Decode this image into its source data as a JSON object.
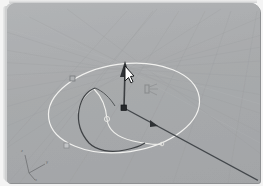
{
  "app": {
    "title": "3D Modeling Viewport",
    "view_label": "Perspective"
  },
  "viewport": {
    "background_color": "#a9abad",
    "grid_color": "#9b9d9f",
    "grid_highlight_color": "#b9bbbd",
    "frame_color": "#f4f4f4",
    "border_radius": "9px"
  },
  "axis_gizmo": {
    "name": "world-axis-indicator",
    "labels": {
      "z": "z",
      "y": "y",
      "x": "x"
    },
    "origin": {
      "x": 22,
      "y": 170
    },
    "color": "#6d6f71"
  },
  "geometry": {
    "circle": {
      "name": "revolve-path-circle",
      "color": "#f0f0ee",
      "center": {
        "x": 117,
        "y": 105
      },
      "radius_x": 76,
      "radius_y": 44,
      "rotation_deg": -8
    },
    "profile_curve": {
      "name": "profile-curve",
      "color": "#3f4245",
      "stroke_width": 1.1
    },
    "surface_curve": {
      "name": "surface-isocurve",
      "color": "#efefec",
      "stroke_width": 1.0
    },
    "axis_line": {
      "name": "revolve-axis-line",
      "color": "#42464a",
      "from": {
        "x": 117,
        "y": 105
      },
      "to": {
        "x": 252,
        "y": 178
      },
      "arrow_at": {
        "x": 147,
        "y": 121
      }
    },
    "z_axis_arrow": {
      "name": "z-direction-arrow",
      "color": "#3b3e41",
      "from": {
        "x": 117,
        "y": 105
      },
      "to": {
        "x": 119,
        "y": 60
      }
    },
    "control_points": [
      {
        "name": "control-point-upper-left",
        "x": 66,
        "y": 76,
        "shape": "square",
        "color": "#8e9093"
      },
      {
        "name": "control-point-lower-left",
        "x": 60,
        "y": 143,
        "shape": "square",
        "color": "#9a9c9e"
      },
      {
        "name": "control-point-origin",
        "x": 117,
        "y": 105,
        "shape": "square",
        "color": "#2e3134"
      },
      {
        "name": "control-point-curve-mid",
        "x": 100,
        "y": 116,
        "shape": "circle",
        "color": "#dededb"
      },
      {
        "name": "control-point-curve-end",
        "x": 126,
        "y": 138,
        "shape": "circle",
        "color": "#dededb"
      }
    ]
  },
  "cursor": {
    "name": "mouse-cursor",
    "x": 116,
    "y": 62,
    "fill": "#ffffff",
    "stroke": "#1a1c1e"
  },
  "gizmo_hint": {
    "name": "transform-gizmo-hint",
    "x": 137,
    "y": 80,
    "color": "#7c7e80"
  }
}
